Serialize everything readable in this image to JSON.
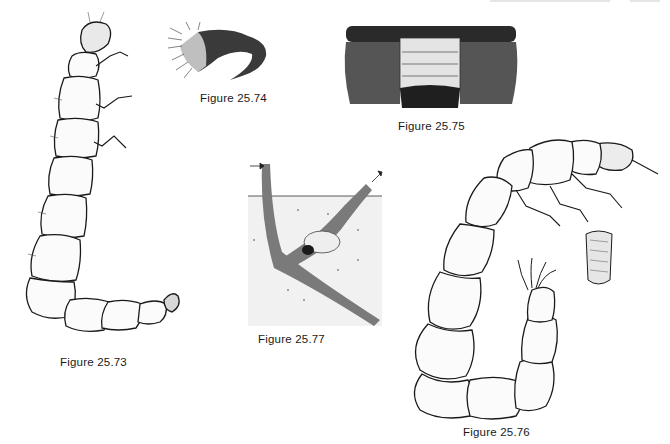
{
  "page": {
    "type": "textbook-figure-page",
    "header_visible": false
  },
  "figures": [
    {
      "id": "fig-73",
      "caption": "Figure 25.73",
      "subject": "elongate segmented larva, lateral view"
    },
    {
      "id": "fig-74",
      "caption": "Figure 25.74",
      "subject": "hairy curved appendage detail"
    },
    {
      "id": "fig-75",
      "caption": "Figure 25.75",
      "subject": "dorsal view of setose segment"
    },
    {
      "id": "fig-76",
      "caption": "Figure 25.76",
      "subject": "curved larva with head and leg details"
    },
    {
      "id": "fig-77",
      "caption": "Figure 25.77",
      "subject": "burrow in substrate with arrows"
    }
  ],
  "colors": {
    "ink": "#1a1a1a",
    "paper": "#ffffff",
    "shade": "#6e6e6e"
  }
}
